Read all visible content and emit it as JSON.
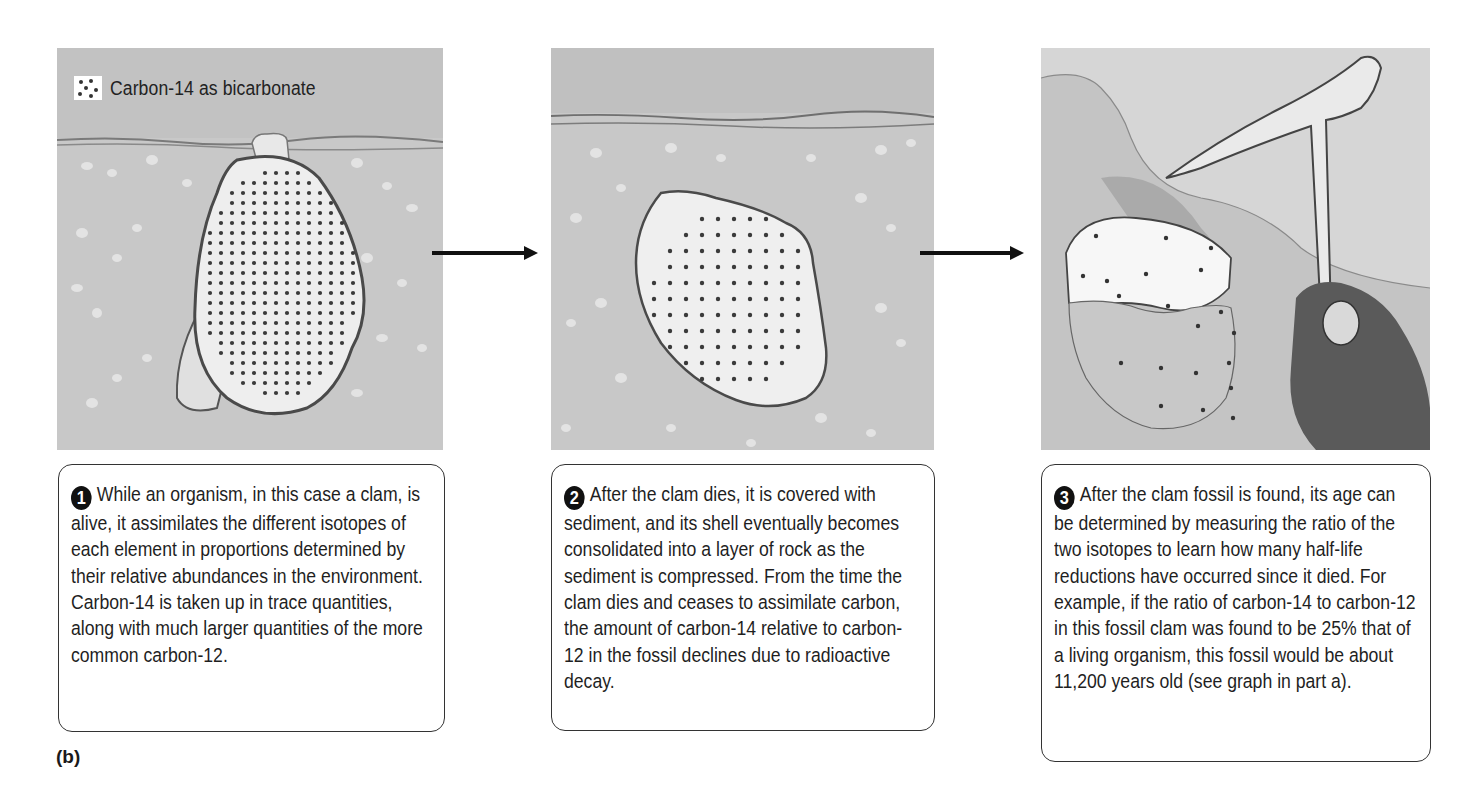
{
  "figure": {
    "part_label": "(b)",
    "legend": {
      "label": "Carbon-14 as bicarbonate",
      "icon": "dotted-square-icon"
    },
    "arrows": [
      "right-arrow-icon",
      "right-arrow-icon"
    ],
    "colors": {
      "background": "#ffffff",
      "sediment": "#c6c6c6",
      "shell": "#f2f2f2",
      "dot": "#333333",
      "arrow": "#111111",
      "box_border": "#333333"
    },
    "panels": [
      {
        "step": "1",
        "illustration": "living clam buried in sediment, shell filled with carbon-14 dots",
        "text": "While an organism, in this case a clam, is alive, it assimilates the different isotopes of each element in proportions determined by their relative abundances in the environment. Carbon-14 is taken up in trace quantities, along with much larger quantities of the more common carbon-12."
      },
      {
        "step": "2",
        "illustration": "dead clam shell covered by sediment layers, fewer carbon-14 dots",
        "text": "After the clam dies, it is covered with sediment, and its shell eventually becomes consolidated into a layer of rock as the sediment is compressed. From the time the clam dies and ceases to assimilate carbon, the amount of carbon-14 relative to carbon-12 in the fossil declines due to radioactive decay."
      },
      {
        "step": "3",
        "illustration": "hand holding rock hammer exposing fossil clam in rock, few carbon-14 dots",
        "text": "After the clam fossil is found, its age can be determined by measuring the ratio of the two isotopes to learn how many half-life reductions have occurred since it died. For example, if the ratio of carbon-14 to carbon-12 in this fossil clam was found to be 25% that of a living organism, this fossil would be about 11,200 years old (see graph in part a)."
      }
    ]
  }
}
